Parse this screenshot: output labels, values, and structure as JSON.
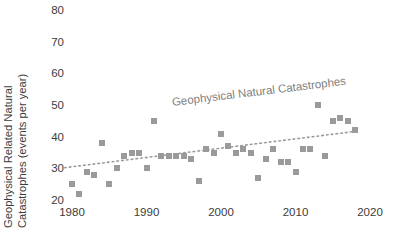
{
  "chart_data": {
    "type": "scatter",
    "title": "",
    "xlabel": "",
    "ylabel": "Geophysical Related Natural Catastrophes (events per year)",
    "ylabel_line1": "Geophysical Related Natural",
    "ylabel_line2": "Catastrophes (events per year)",
    "annotation": "Geophysical Natural Catastrophes",
    "series_name": "Geophysical Natural Catastrophes",
    "marker_color": "#9a9a9a",
    "trendline_color": "#9a9a9a",
    "trendline_style": "dotted",
    "grid": false,
    "legend_position": "none",
    "xlim": [
      1978,
      2021
    ],
    "ylim": [
      17,
      80
    ],
    "xticks": [
      1980,
      1990,
      2000,
      2010,
      2020
    ],
    "yticks": [
      20,
      30,
      40,
      50,
      60,
      70,
      80
    ],
    "x": [
      1980,
      1981,
      1982,
      1983,
      1984,
      1985,
      1986,
      1987,
      1988,
      1989,
      1990,
      1991,
      1992,
      1993,
      1994,
      1995,
      1996,
      1997,
      1998,
      1999,
      2000,
      2001,
      2002,
      2003,
      2004,
      2005,
      2006,
      2007,
      2008,
      2009,
      2010,
      2011,
      2012,
      2013,
      2014,
      2015,
      2016,
      2017,
      2018
    ],
    "y": [
      25,
      22,
      29,
      28,
      38,
      25,
      30,
      34,
      35,
      35,
      30,
      45,
      34,
      34,
      34,
      34,
      33,
      26,
      36,
      35,
      41,
      37,
      35,
      36,
      35,
      27,
      33,
      36,
      32,
      32,
      29,
      36,
      36,
      50,
      34,
      45,
      46,
      45,
      42
    ],
    "trendline": {
      "x_start": 1979,
      "y_start": 30.2,
      "x_end": 2018.5,
      "y_end": 41.8
    }
  }
}
